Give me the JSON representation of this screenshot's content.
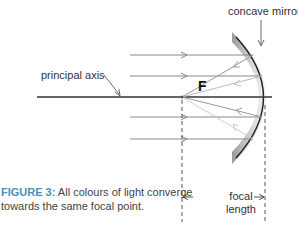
{
  "diagram": {
    "labels": {
      "mirror": "concave mirror",
      "axis": "principal axis",
      "focal_point": "F",
      "focal_length_line1": "focal",
      "focal_length_line2": "length"
    },
    "caption": {
      "figure": "FIGURE 3:",
      "text_line1": " All colours of light converge",
      "text_line2": "towards the same focal point."
    },
    "colors": {
      "ray": "#888888",
      "axis": "#333333",
      "mirror_edge": "#222222",
      "caption_accent": "#4a90b8"
    },
    "incoming_rays_y": [
      55,
      76,
      117,
      139
    ],
    "focal_point": {
      "x": 182,
      "y": 97
    }
  }
}
